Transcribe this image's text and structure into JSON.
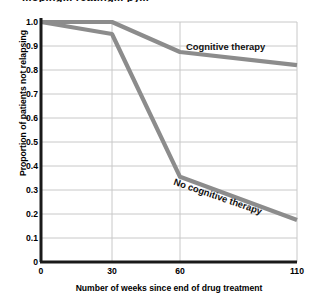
{
  "cut_title": "...oping... reating... py...",
  "chart_data": {
    "type": "line",
    "title": "",
    "xlabel": "Number of weeks since end of drug treatment",
    "ylabel": "Proportion of patients not relapsing",
    "xticks": [
      0,
      30,
      60,
      110
    ],
    "xtick_labels": [
      "0",
      "30",
      "60",
      "110"
    ],
    "xtick_positions_px": [
      41,
      112,
      180,
      297
    ],
    "yticks": [
      0,
      0.1,
      0.2,
      0.3,
      0.4,
      0.5,
      0.6,
      0.7,
      0.8,
      0.9,
      1.0
    ],
    "ytick_labels": [
      "0",
      "0.1",
      "0.2",
      "0.3",
      "0.4",
      "0.5",
      "0.6",
      "0.7",
      "0.8",
      "0.9",
      "1.0"
    ],
    "ylim": [
      0,
      1.0
    ],
    "grid": true,
    "legend": "inline-annotations",
    "x": [
      0,
      30,
      60,
      110
    ],
    "series": [
      {
        "name": "Cognitive therapy",
        "values": [
          1.0,
          1.0,
          0.875,
          0.82
        ],
        "color": "#8c8c8c"
      },
      {
        "name": "No cognitive therapy",
        "values": [
          1.0,
          0.95,
          0.355,
          0.175
        ],
        "color": "#8c8c8c"
      }
    ],
    "annotations": [
      {
        "text": "Cognitive therapy",
        "rotation_deg": 0
      },
      {
        "text": "No cognitive therapy",
        "rotation_deg": 19
      }
    ],
    "colors": {
      "line": "#8c8c8c",
      "grid": "#c8c8c8",
      "axis": "#1a1a1a",
      "background": "#ffffff"
    }
  }
}
